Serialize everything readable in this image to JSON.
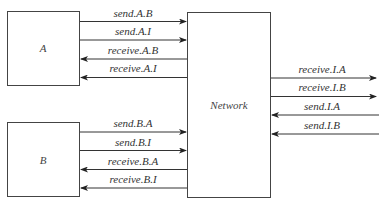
{
  "nodes": {
    "a": {
      "label": "A"
    },
    "b": {
      "label": "B"
    },
    "network": {
      "label": "Network"
    }
  },
  "edges": {
    "send_a_b": "send.A.B",
    "send_a_i": "send.A.I",
    "receive_a_b": "receive.A.B",
    "receive_a_i": "receive.A.I",
    "send_b_a": "send.B.A",
    "send_b_i": "send.B.I",
    "receive_b_a": "receive.B.A",
    "receive_b_i": "receive.B.I",
    "receive_i_a": "receive.I.A",
    "receive_i_b": "receive.I.B",
    "send_i_a": "send.I.A",
    "send_i_b": "send.I.B"
  },
  "colors": {
    "stroke": "#333333",
    "background": "#ffffff"
  }
}
